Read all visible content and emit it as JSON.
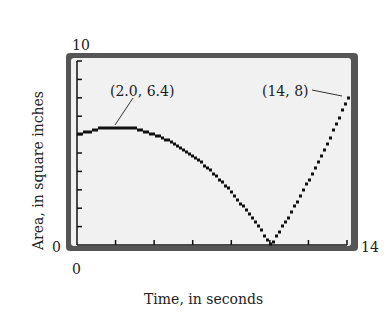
{
  "chart_data": {
    "type": "line",
    "title": "",
    "xlabel": "Time, in seconds",
    "ylabel": "Area, in square inches",
    "xlim": [
      0,
      14
    ],
    "ylim": [
      0,
      10
    ],
    "x_tick_labels": [
      "0",
      "14"
    ],
    "y_tick_labels": [
      "0",
      "10"
    ],
    "x_ticks_count": 7,
    "y_ticks_count": 10,
    "grid": false,
    "style": "graphing-calculator pixel plot",
    "series": [
      {
        "name": "Area",
        "x": [
          0,
          1,
          2,
          3,
          4,
          5,
          6,
          7,
          8,
          9,
          10,
          11,
          12,
          13,
          14
        ],
        "values": [
          6.0,
          6.3,
          6.4,
          6.3,
          6.0,
          5.5,
          4.8,
          3.9,
          2.8,
          1.5,
          0.0,
          1.7,
          3.6,
          5.7,
          8.0
        ]
      }
    ],
    "annotations": [
      {
        "text": "(2.0, 6.4)",
        "x": 2.0,
        "y": 6.4
      },
      {
        "text": "(14, 8)",
        "x": 14,
        "y": 8
      }
    ]
  },
  "labels": {
    "y_max": "10",
    "y_min": "0",
    "x_min": "0",
    "x_max": "14",
    "xlabel": "Time, in seconds",
    "ylabel": "Area, in square inches",
    "ann1": "(2.0, 6.4)",
    "ann2": "(14, 8)"
  }
}
